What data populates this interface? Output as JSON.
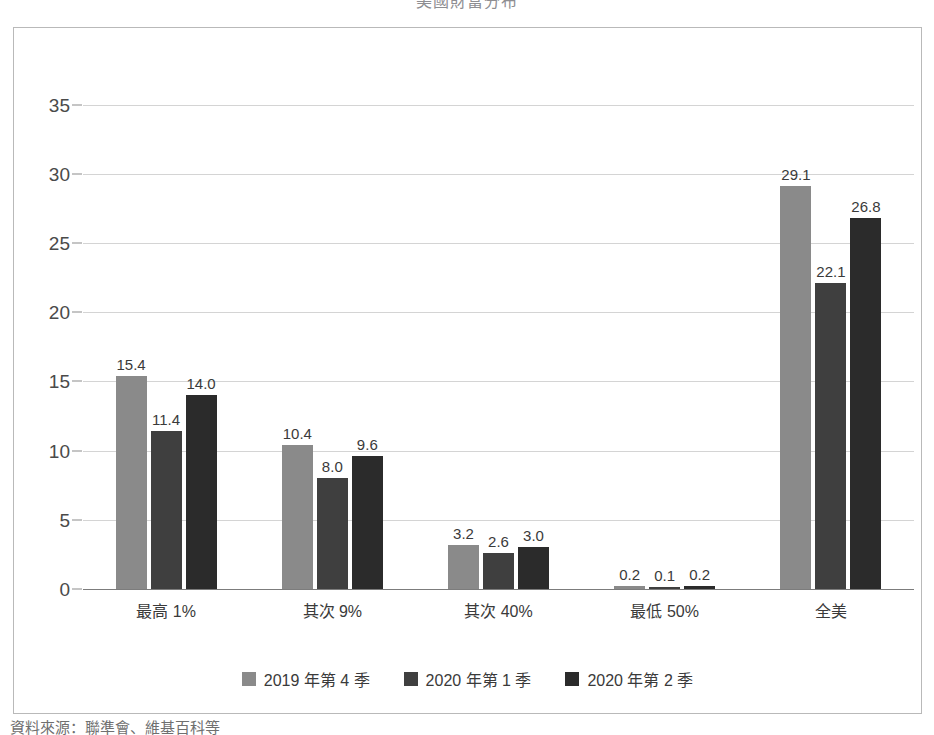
{
  "chart_data": {
    "type": "bar",
    "title": "美國財富分布",
    "subtitle": "",
    "xlabel": "",
    "ylabel": "",
    "ylim": [
      0,
      37.5
    ],
    "yticks": [
      0,
      5,
      10,
      15,
      20,
      25,
      30,
      35
    ],
    "ytick_labels": [
      "0",
      "5",
      "10",
      "15",
      "20",
      "25",
      "30",
      "35"
    ],
    "grid": true,
    "legend_position": "bottom",
    "categories": [
      "最高 1%",
      "其次 9%",
      "其次 40%",
      "最低 50%",
      "全美"
    ],
    "series": [
      {
        "name": "2019 年第 4 季",
        "color": "#8a8a8a",
        "values": [
          15.4,
          10.4,
          3.2,
          0.2,
          29.1
        ],
        "labels": [
          "15.4",
          "10.4",
          "3.2",
          "0.2",
          "29.1"
        ]
      },
      {
        "name": "2020 年第 1 季",
        "color": "#3f3f3f",
        "values": [
          11.4,
          8.0,
          2.6,
          0.1,
          22.1
        ],
        "labels": [
          "11.4",
          "8.0",
          "2.6",
          "0.1",
          "22.1"
        ]
      },
      {
        "name": "2020 年第 2 季",
        "color": "#2b2b2b",
        "values": [
          14.0,
          9.6,
          3.0,
          0.2,
          26.8
        ],
        "labels": [
          "14.0",
          "9.6",
          "3.0",
          "0.2",
          "26.8"
        ]
      }
    ]
  },
  "footnote": "資料來源：聯準會、維基百科等"
}
